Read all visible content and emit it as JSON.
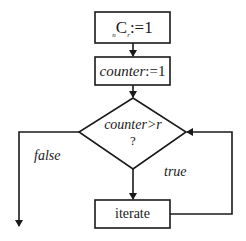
{
  "flowchart": {
    "nodes": {
      "init_combination": {
        "prefix_sub": "n",
        "symbol": "C",
        "suffix_sub": "r",
        "assign": ":=1"
      },
      "init_counter": {
        "var": "counter",
        "assign": ":=1"
      },
      "decision": {
        "condition": "counter>r",
        "question_mark": "?"
      },
      "iterate": {
        "label": "iterate"
      }
    },
    "edges": {
      "false_label": "false",
      "true_label": "true"
    },
    "colors": {
      "stroke": "#1a1a1a",
      "background": "#ffffff"
    }
  }
}
